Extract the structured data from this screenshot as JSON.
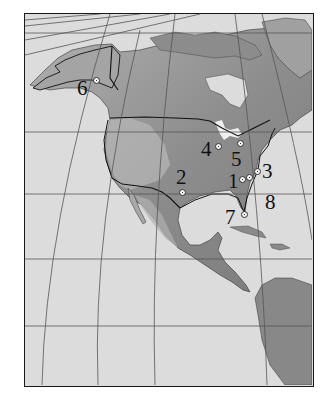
{
  "map": {
    "region": "North America",
    "style": "grayscale shaded relief with graticule",
    "colors": {
      "ocean": "#dcdcdc",
      "land_low": "#8a8a8a",
      "land_high": "#b5b5b5",
      "ice": "#e6e6e6",
      "border": "#111111",
      "graticule": "#555555"
    },
    "markers": [
      {
        "id": "1",
        "label": "1",
        "x": 242,
        "y": 179,
        "label_x": 228,
        "label_y": 171
      },
      {
        "id": "2",
        "label": "2",
        "x": 182,
        "y": 192,
        "label_x": 176,
        "label_y": 167
      },
      {
        "id": "3",
        "label": "3",
        "x": 257,
        "y": 171,
        "label_x": 262,
        "label_y": 161
      },
      {
        "id": "4",
        "label": "4",
        "x": 218,
        "y": 146,
        "label_x": 201,
        "label_y": 139
      },
      {
        "id": "5",
        "label": "5",
        "x": 240,
        "y": 143,
        "label_x": 231,
        "label_y": 149
      },
      {
        "id": "6",
        "label": "6",
        "x": 96,
        "y": 80,
        "label_x": 77,
        "label_y": 78
      },
      {
        "id": "7",
        "label": "7",
        "x": 244,
        "y": 214,
        "label_x": 225,
        "label_y": 207
      },
      {
        "id": "8",
        "label": "8",
        "x": 249,
        "y": 177,
        "label_x": 265,
        "label_y": 192
      }
    ]
  }
}
